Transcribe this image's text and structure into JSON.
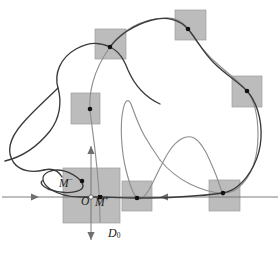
{
  "figure": {
    "background_color": "#ffffff",
    "curve_color_dark": "#3b3b3b",
    "curve_color_light": "#8f8f8f",
    "axis_color": "#6f6f6f",
    "box_fill": "#bcbcbc",
    "box_stroke": "#9a9a9a",
    "dot_color": "#111111",
    "origin_dot_fill": "#ffffff"
  },
  "labels": {
    "m_minus": "M",
    "m_minus_sup": "−",
    "origin": "O",
    "m_plus": "M",
    "m_plus_sup": "+",
    "domain": "D",
    "domain_sub": "0"
  },
  "axes": {
    "horizontal": {
      "name": "unstable-axis",
      "x1": 2,
      "x2": 278,
      "y": 197,
      "arrows": [
        {
          "at_x": 36,
          "direction": "right"
        },
        {
          "at_x": 163,
          "direction": "left"
        }
      ]
    },
    "vertical": {
      "name": "stable-axis",
      "x": 91,
      "y1": 146,
      "y2": 240,
      "arrows": [
        {
          "at_y": 151,
          "direction": "up"
        },
        {
          "at_y": 235,
          "direction": "down"
        }
      ]
    }
  },
  "origin_point": {
    "x": 91,
    "y": 197,
    "label": "O"
  },
  "marked_points": [
    {
      "name": "m-minus-point",
      "x": 82,
      "y": 181
    },
    {
      "name": "m-plus-point",
      "x": 100,
      "y": 197
    }
  ],
  "boxes": [
    {
      "name": "box-d0",
      "x": 63,
      "y": 168,
      "w": 57,
      "h": 55
    },
    {
      "name": "box-left-middle",
      "x": 71,
      "y": 93,
      "w": 29,
      "h": 31
    },
    {
      "name": "box-top-left",
      "x": 95,
      "y": 29,
      "w": 31,
      "h": 30
    },
    {
      "name": "box-top-right",
      "x": 175,
      "y": 10,
      "w": 31,
      "h": 30
    },
    {
      "name": "box-right",
      "x": 232,
      "y": 76,
      "w": 30,
      "h": 31
    },
    {
      "name": "box-bottom-mid",
      "x": 122,
      "y": 181,
      "w": 30,
      "h": 30
    },
    {
      "name": "box-bottom-right",
      "x": 209,
      "y": 180,
      "w": 31,
      "h": 31
    }
  ],
  "intersection_dots": [
    {
      "name": "dot-left-middle",
      "x": 90,
      "y": 109
    },
    {
      "name": "dot-top-left",
      "x": 110,
      "y": 47
    },
    {
      "name": "dot-top-right",
      "x": 188,
      "y": 29
    },
    {
      "name": "dot-right",
      "x": 247,
      "y": 91
    },
    {
      "name": "dot-bottom-mid",
      "x": 137,
      "y": 198
    },
    {
      "name": "dot-bottom-right",
      "x": 223,
      "y": 193
    }
  ],
  "curves": {
    "unstable_manifold": {
      "name": "unstable-manifold-curve",
      "color": "#3b3b3b",
      "description": "Dark meandering curve entering from the left, folding through the left lobes, crossing the boxes along the top and down the right side."
    },
    "stable_manifold": {
      "name": "stable-manifold-curve",
      "color": "#8f8f8f",
      "description": "Lighter curve rising from the origin box, oscillating with two tall peaks across the middle and looping around the right side."
    }
  }
}
